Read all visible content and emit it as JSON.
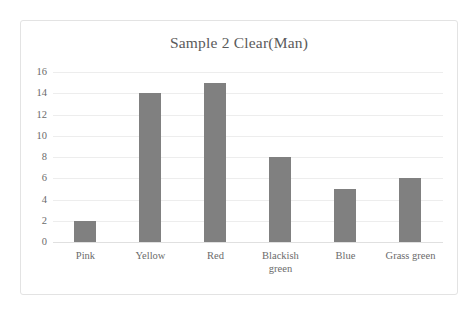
{
  "chart_data": {
    "type": "bar",
    "title": "Sample 2 Clear(Man)",
    "xlabel": "",
    "ylabel": "",
    "categories": [
      "Pink",
      "Yellow",
      "Red",
      "Blackish\ngreen",
      "Blue",
      "Grass green"
    ],
    "values": [
      2,
      14,
      15,
      8,
      5,
      6
    ],
    "yticks": [
      0,
      2,
      4,
      6,
      8,
      10,
      12,
      14,
      16
    ],
    "ylim": [
      0,
      16
    ],
    "grid": true,
    "legend": false,
    "colors": {
      "bar_fill": "#808080",
      "gridline": "#ededed",
      "text": "#6b6b6b",
      "title_text": "#5a5a5a",
      "frame_border": "#e3e3e3",
      "background": "#ffffff"
    }
  }
}
